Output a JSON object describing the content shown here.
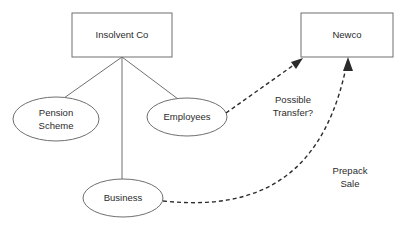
{
  "diagram": {
    "background_color": "#ffffff",
    "shape_stroke_color": "#6f6f6f",
    "text_color": "#2b2b2b",
    "dashed_edge_color": "#2b2b2b",
    "nodes": [
      {
        "id": "insolvent-co",
        "shape": "rectangle",
        "label": "Insolvent Co",
        "label_lines": [
          "Insolvent Co"
        ],
        "x": 72,
        "y": 13,
        "width": 100,
        "height": 44
      },
      {
        "id": "newco",
        "shape": "rectangle",
        "label": "Newco",
        "label_lines": [
          "Newco"
        ],
        "x": 301,
        "y": 13,
        "width": 92,
        "height": 44
      },
      {
        "id": "pension-scheme",
        "shape": "ellipse",
        "label": "Pension Scheme",
        "label_lines": [
          "Pension",
          "Scheme"
        ],
        "cx": 56,
        "cy": 119,
        "rx": 43,
        "ry": 22
      },
      {
        "id": "employees",
        "shape": "ellipse",
        "label": "Employees",
        "label_lines": [
          "Employees"
        ],
        "cx": 187,
        "cy": 117,
        "rx": 40,
        "ry": 19
      },
      {
        "id": "business",
        "shape": "ellipse",
        "label": "Business",
        "label_lines": [
          "Business"
        ],
        "cx": 123,
        "cy": 198,
        "rx": 40,
        "ry": 19
      }
    ],
    "edges": [
      {
        "id": "insolvent-to-pension",
        "from": "insolvent-co",
        "to": "pension-scheme",
        "style": "solid",
        "arrow": false,
        "label": ""
      },
      {
        "id": "insolvent-to-business",
        "from": "insolvent-co",
        "to": "business",
        "style": "solid",
        "arrow": false,
        "label": ""
      },
      {
        "id": "insolvent-to-employees",
        "from": "insolvent-co",
        "to": "employees",
        "style": "solid",
        "arrow": false,
        "label": ""
      },
      {
        "id": "employees-to-newco",
        "from": "employees",
        "to": "newco",
        "style": "dashed",
        "arrow": true,
        "label": "Possible Transfer?",
        "label_lines": [
          "Possible",
          "Transfer?"
        ],
        "label_x": 293,
        "label_y": 106
      },
      {
        "id": "business-to-newco",
        "from": "business",
        "to": "newco",
        "style": "dashed",
        "arrow": true,
        "label": "Prepack Sale",
        "label_lines": [
          "Prepack",
          "Sale"
        ],
        "label_x": 350,
        "label_y": 177
      }
    ]
  }
}
